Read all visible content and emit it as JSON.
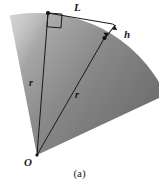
{
  "figure": {
    "caption": "(a)",
    "center_label": "O",
    "labels": {
      "chord": "L",
      "sagitta": "h",
      "radius_left": "r",
      "radius_right": "r"
    },
    "colors": {
      "fill_light": "#a8a8a8",
      "fill_mid": "#8c8c8c",
      "fill_dark": "#6f6f6f",
      "stroke": "#1a1a1a",
      "background": "#ffffff",
      "text": "#1a1a1a"
    },
    "geometry": {
      "center": {
        "x": 37,
        "y": 155
      },
      "radius": 142,
      "sector_start_angle_deg": -101,
      "sector_end_angle_deg": -25,
      "chord_start": {
        "x": 48,
        "y": 13
      },
      "chord_end": {
        "x": 105,
        "y": 37
      },
      "right_angle_marker": {
        "x": 48,
        "y": 13,
        "size": 14
      },
      "radius_line_left_end": {
        "x": 48,
        "y": 13
      },
      "radius_line_right_end": {
        "x": 105,
        "y": 37
      }
    }
  }
}
